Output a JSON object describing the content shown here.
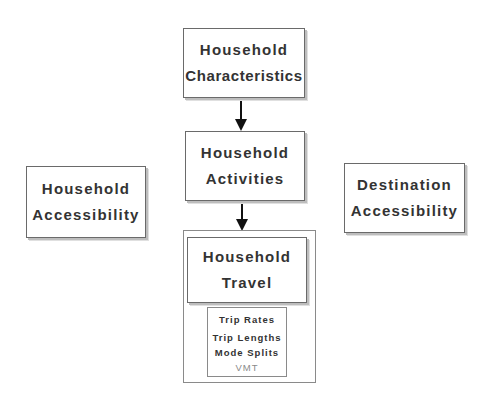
{
  "diagram": {
    "type": "flowchart",
    "nodes": {
      "household_characteristics": {
        "lines": [
          "Household",
          "Characteristics"
        ]
      },
      "household_activities": {
        "lines": [
          "Household",
          "Activities"
        ]
      },
      "household_accessibility": {
        "lines": [
          "Household",
          "Accessibility"
        ]
      },
      "destination_accessibility": {
        "lines": [
          "Destination",
          "Accessibility"
        ]
      },
      "household_travel": {
        "lines": [
          "Household",
          "Travel"
        ],
        "outputs": [
          "Trip Rates",
          "Trip Lengths",
          "Mode Splits",
          "VMT"
        ]
      }
    },
    "edges": [
      {
        "from": "household_characteristics",
        "to": "household_activities"
      },
      {
        "from": "household_activities",
        "to": "household_travel"
      }
    ],
    "colors": {
      "border": "#6a6a6a",
      "text": "#333333",
      "muted_text": "#8a8a8a",
      "arrow": "#111111"
    }
  }
}
